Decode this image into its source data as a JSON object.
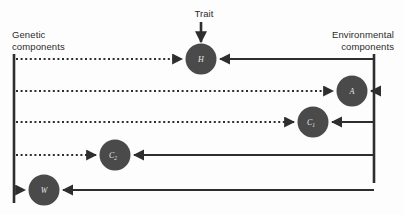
{
  "figure": {
    "title_trait": "Trait",
    "left_axis_label": "Genetic\ncomponents",
    "right_axis_label": "Environmental\ncomponents",
    "colors": {
      "node_fill": "#4a4a4a",
      "node_label": "#e9e9e9",
      "line": "#2e2e2e",
      "text": "#2b2b2b",
      "background": "#fdfdfd"
    }
  },
  "nodes": [
    {
      "id": "H",
      "letter": "H",
      "subscript": "",
      "cx": 201,
      "cy": 59,
      "r": 15.5,
      "row": 1
    },
    {
      "id": "A",
      "letter": "A",
      "subscript": "",
      "cx": 352,
      "cy": 91,
      "r": 15.5,
      "row": 2
    },
    {
      "id": "C1",
      "letter": "C",
      "subscript": "1",
      "cx": 313,
      "cy": 122,
      "r": 15.5,
      "row": 3
    },
    {
      "id": "C2",
      "letter": "C",
      "subscript": "2",
      "cx": 115,
      "cy": 155,
      "r": 15.5,
      "row": 4
    },
    {
      "id": "W",
      "letter": "W",
      "subscript": "",
      "cx": 44,
      "cy": 190,
      "r": 15.5,
      "row": 5
    }
  ],
  "axes": {
    "left_line": {
      "x": 14,
      "y_top": 54,
      "y_bottom": 203
    },
    "right_line": {
      "x": 374,
      "y_top": 54,
      "y_bottom": 183
    }
  },
  "rows": [
    {
      "row": 1,
      "y": 59,
      "genetic_arrow_to": "H",
      "environmental_arrow_to": "H",
      "genetic_start_x": 17,
      "genetic_end_x": 184,
      "env_start_x": 374,
      "env_end_x": 218
    },
    {
      "row": 2,
      "y": 91,
      "genetic_arrow_to": "A",
      "environmental_arrow_to": "A",
      "genetic_start_x": 17,
      "genetic_end_x": 335,
      "env_start_x": 374,
      "env_end_x": 369
    },
    {
      "row": 3,
      "y": 122,
      "genetic_arrow_to": "C1",
      "environmental_arrow_to": "C1",
      "genetic_start_x": 17,
      "genetic_end_x": 296,
      "env_start_x": 374,
      "env_end_x": 330
    },
    {
      "row": 4,
      "y": 155,
      "genetic_arrow_to": "C2",
      "environmental_arrow_to": "C2",
      "genetic_start_x": 17,
      "genetic_end_x": 98,
      "env_start_x": 374,
      "env_end_x": 132
    },
    {
      "row": 5,
      "y": 190,
      "genetic_arrow_to": "W",
      "environmental_arrow_to": "W",
      "genetic_start_x": 17,
      "genetic_end_x": 27,
      "env_start_x": 374,
      "env_end_x": 61
    }
  ],
  "trait_arrow": {
    "x": 201,
    "y_top": 21,
    "y_bottom": 42
  }
}
